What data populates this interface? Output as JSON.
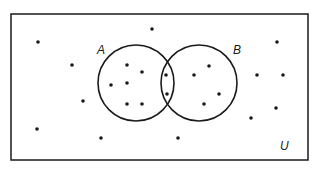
{
  "diagram": {
    "type": "venn",
    "universe_label": "U",
    "sets": [
      {
        "label": "A",
        "cx": 136,
        "cy": 83,
        "r": 38,
        "label_x": 97,
        "label_y": 54
      },
      {
        "label": "B",
        "cx": 199,
        "cy": 83,
        "r": 38,
        "label_x": 233,
        "label_y": 54
      }
    ],
    "universe_box": {
      "x": 11,
      "y": 14,
      "w": 297,
      "h": 146,
      "label_x": 280,
      "label_y": 150
    },
    "colors": {
      "stroke": "#1a1a1a",
      "background": "#ffffff"
    },
    "counts": {
      "A_only": 6,
      "A_and_B": 2,
      "B_only": 4,
      "outside": 12,
      "total": 24
    },
    "points": {
      "A_only": [
        [
          111,
          85
        ],
        [
          127,
          65
        ],
        [
          142,
          72
        ],
        [
          127,
          83
        ],
        [
          127,
          104
        ],
        [
          142,
          104
        ]
      ],
      "A_and_B": [
        [
          166,
          75
        ],
        [
          167,
          94
        ]
      ],
      "B_only": [
        [
          209,
          66
        ],
        [
          194,
          75
        ],
        [
          219,
          94
        ],
        [
          204,
          104
        ]
      ],
      "outside": [
        [
          38,
          42
        ],
        [
          72,
          65
        ],
        [
          152,
          29
        ],
        [
          83,
          101
        ],
        [
          37,
          129
        ],
        [
          101,
          138
        ],
        [
          178,
          138
        ],
        [
          277,
          42
        ],
        [
          257,
          75
        ],
        [
          283,
          75
        ],
        [
          251,
          118
        ],
        [
          276,
          108
        ]
      ]
    }
  }
}
